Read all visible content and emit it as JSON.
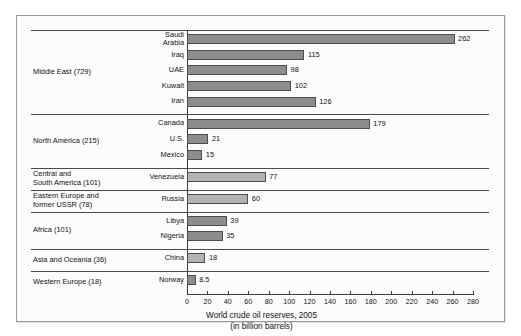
{
  "figure": {
    "caption_line1": "World crude oil reserves, 2005",
    "caption_line2": "(in billion barrels)"
  },
  "chart_data": {
    "type": "bar",
    "orientation": "horizontal",
    "title": "World crude oil reserves, 2005",
    "subtitle": "(in billion barrels)",
    "xlabel": "",
    "ylabel": "",
    "xlim": [
      0,
      280
    ],
    "xticks": [
      0,
      20,
      40,
      60,
      80,
      100,
      120,
      140,
      160,
      180,
      200,
      220,
      240,
      260,
      280
    ],
    "tick_step": 20,
    "grid": false,
    "legend": "none",
    "units": "billion barrels",
    "categories": [
      "Saudi Arabia",
      "Iraq",
      "UAE",
      "Kuwait",
      "Iran",
      "Canada",
      "U.S.",
      "Mexico",
      "Venezuela",
      "Russia",
      "Libya",
      "Nigeria",
      "China",
      "Norway"
    ],
    "values": [
      262,
      115,
      98,
      102,
      126,
      179,
      21,
      15,
      77,
      60,
      39,
      35,
      18,
      8.5
    ],
    "groups": [
      {
        "region": "Middle East",
        "total": 729,
        "label": "Middle East (729)",
        "bars": [
          {
            "name": "Saudi Arabia",
            "name_lines": [
              "Saudi",
              "Arabia"
            ],
            "value": 262,
            "value_label": "262",
            "shade": "dark"
          },
          {
            "name": "Iraq",
            "name_lines": [
              "Iraq"
            ],
            "value": 115,
            "value_label": "115",
            "shade": "dark"
          },
          {
            "name": "UAE",
            "name_lines": [
              "UAE"
            ],
            "value": 98,
            "value_label": "98",
            "shade": "dark"
          },
          {
            "name": "Kuwait",
            "name_lines": [
              "Kuwait"
            ],
            "value": 102,
            "value_label": "102",
            "shade": "dark"
          },
          {
            "name": "Iran",
            "name_lines": [
              "Iran"
            ],
            "value": 126,
            "value_label": "126",
            "shade": "dark"
          }
        ]
      },
      {
        "region": "North America",
        "total": 215,
        "label": "North America (215)",
        "bars": [
          {
            "name": "Canada",
            "name_lines": [
              "Canada"
            ],
            "value": 179,
            "value_label": "179",
            "shade": "dark"
          },
          {
            "name": "U.S.",
            "name_lines": [
              "U.S."
            ],
            "value": 21,
            "value_label": "21",
            "shade": "dark"
          },
          {
            "name": "Mexico",
            "name_lines": [
              "Mexico"
            ],
            "value": 15,
            "value_label": "15",
            "shade": "dark"
          }
        ]
      },
      {
        "region": "Central and South America",
        "total": 101,
        "label": "Central and South America (101)",
        "label_lines": [
          "Central and",
          "South America (101)"
        ],
        "bars": [
          {
            "name": "Venezuela",
            "name_lines": [
              "Venezuela"
            ],
            "value": 77,
            "value_label": "77",
            "shade": "light"
          }
        ]
      },
      {
        "region": "Eastern Europe and former USSR",
        "total": 78,
        "label": "Eastern Europe and former USSR (78)",
        "label_lines": [
          "Eastern Europe and",
          "former USSR (78)"
        ],
        "bars": [
          {
            "name": "Russia",
            "name_lines": [
              "Russia"
            ],
            "value": 60,
            "value_label": "60",
            "shade": "light"
          }
        ]
      },
      {
        "region": "Africa",
        "total": 101,
        "label": "Africa (101)",
        "bars": [
          {
            "name": "Libya",
            "name_lines": [
              "Libya"
            ],
            "value": 39,
            "value_label": "39",
            "shade": "dark"
          },
          {
            "name": "Nigeria",
            "name_lines": [
              "Nigeria"
            ],
            "value": 35,
            "value_label": "35",
            "shade": "dark"
          }
        ]
      },
      {
        "region": "Asia and Oceania",
        "total": 36,
        "label": "Asia and Oceania (36)",
        "bars": [
          {
            "name": "China",
            "name_lines": [
              "China"
            ],
            "value": 18,
            "value_label": "18",
            "shade": "light"
          }
        ]
      },
      {
        "region": "Western Europe",
        "total": 18,
        "label": "Western Europe (18)",
        "bars": [
          {
            "name": "Norway",
            "name_lines": [
              "Norway"
            ],
            "value": 8.5,
            "value_label": "8.5",
            "shade": "dark"
          }
        ]
      }
    ]
  },
  "colors": {
    "bar_dark": "#8d8d8d",
    "bar_light": "#b3b3b3",
    "bar_border": "#4c4c4c",
    "axis": "#3a3a3a",
    "rule": "#4a4a4a",
    "frame": "#9a9a9a",
    "text": "#111111",
    "page_background": "#ffffff",
    "figure_background": "#fcfcfc"
  }
}
